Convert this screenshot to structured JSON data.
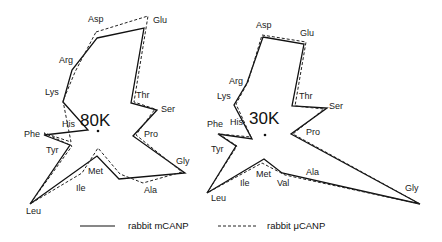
{
  "figure": {
    "panels": [
      {
        "id": "80k",
        "title": "80K",
        "center": [
          98,
          131
        ],
        "labels": [
          {
            "text": "Asp",
            "x": 88,
            "y": 22
          },
          {
            "text": "Glu",
            "x": 153,
            "y": 23
          },
          {
            "text": "Arg",
            "x": 59,
            "y": 63
          },
          {
            "text": "Lys",
            "x": 45,
            "y": 95
          },
          {
            "text": "Thr",
            "x": 136,
            "y": 98
          },
          {
            "text": "Ser",
            "x": 161,
            "y": 112
          },
          {
            "text": "His",
            "x": 62,
            "y": 127
          },
          {
            "text": "Pro",
            "x": 144,
            "y": 137
          },
          {
            "text": "Phe",
            "x": 24,
            "y": 137
          },
          {
            "text": "Tyr",
            "x": 46,
            "y": 153
          },
          {
            "text": "Gly",
            "x": 176,
            "y": 164
          },
          {
            "text": "Met",
            "x": 88,
            "y": 174
          },
          {
            "text": "Ile",
            "x": 76,
            "y": 191
          },
          {
            "text": "Ala",
            "x": 144,
            "y": 193
          },
          {
            "text": "Leu",
            "x": 26,
            "y": 214
          }
        ],
        "solid_points": "97,38 144,28 131,103 157,110 133,136 185,173 119,179 97,156 30,204 70,145 44,135 88,130 63,102 72,70 97,38",
        "dashed_points": "96,32 148,16 134,102 155,109 136,135 182,172 143,183 120,174 98,148 82,173 30,204 72,146 44,133 71,142 63,101 75,72 96,32"
      },
      {
        "id": "30k",
        "title": "30K",
        "center": [
          265,
          135
        ],
        "labels": [
          {
            "text": "Asp",
            "x": 256,
            "y": 28
          },
          {
            "text": "Glu",
            "x": 300,
            "y": 36
          },
          {
            "text": "Arg",
            "x": 229,
            "y": 84
          },
          {
            "text": "Lys",
            "x": 217,
            "y": 99
          },
          {
            "text": "Thr",
            "x": 299,
            "y": 99
          },
          {
            "text": "Ser",
            "x": 329,
            "y": 109
          },
          {
            "text": "His",
            "x": 230,
            "y": 125
          },
          {
            "text": "Phe",
            "x": 207,
            "y": 127
          },
          {
            "text": "Pro",
            "x": 306,
            "y": 135
          },
          {
            "text": "Tyr",
            "x": 211,
            "y": 152
          },
          {
            "text": "Ala",
            "x": 306,
            "y": 175
          },
          {
            "text": "Met",
            "x": 256,
            "y": 177
          },
          {
            "text": "Ile",
            "x": 240,
            "y": 186
          },
          {
            "text": "Val",
            "x": 277,
            "y": 186
          },
          {
            "text": "Gly",
            "x": 405,
            "y": 191
          },
          {
            "text": "Leu",
            "x": 211,
            "y": 201
          }
        ],
        "solid_points": "263,37 304,44 292,106 327,108 291,134 420,204 282,173 264,159 207,193 236,146 218,134 252,139 234,105 247,83 263,37",
        "dashed_points": "262,35 306,42 295,106 324,109 293,134 420,204 285,175 262,163 207,193 237,146 219,134 251,137 236,104 248,82 262,35"
      }
    ],
    "legend": [
      {
        "style": "solid",
        "label": "rabbit mCANP"
      },
      {
        "style": "dashed",
        "label": "rabbit μCANP"
      }
    ]
  }
}
